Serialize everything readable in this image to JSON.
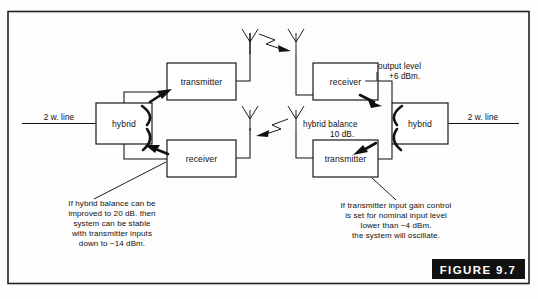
{
  "figure": {
    "label": "FIGURE 9.7",
    "number": "9.7"
  },
  "lines": {
    "left_2w": "2 w. line",
    "right_2w": "2 w. line"
  },
  "blocks": {
    "left_hybrid": "hybrid",
    "left_transmitter": "transmitter",
    "left_receiver": "receiver",
    "right_hybrid": "hybrid",
    "right_transmitter": "transmitter",
    "right_receiver": "receiver"
  },
  "callouts": {
    "output_level_line1": "output level",
    "output_level_line2": "+6 dBm.",
    "hybrid_balance_line1": "hybrid balance",
    "hybrid_balance_line2": "10 dB."
  },
  "notes": {
    "left": {
      "line1": "If hybrid balance can be",
      "line2": "improved to 20 dB. then",
      "line3": "system can be stable",
      "line4": "with transmitter inputs",
      "line5": "down to −14 dBm."
    },
    "right": {
      "line1": "If transmitter input gain control",
      "line2": "is set for nominal input level",
      "line3": "lower than −4 dBm.",
      "line4": "the system will oscillate."
    }
  },
  "icons": {
    "antenna_tx_left": "antenna-icon",
    "antenna_rx_right": "antenna-icon",
    "antenna_rx_left": "antenna-icon",
    "antenna_tx_right": "antenna-icon",
    "rf_path_upper": "rf-propagation-arrow-icon",
    "rf_path_lower": "rf-propagation-arrow-icon"
  },
  "colors": {
    "ink": "#111111",
    "paper": "#ffffff",
    "band": "#111111",
    "band_text": "#ffffff"
  }
}
